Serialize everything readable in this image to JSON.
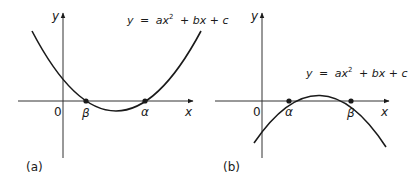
{
  "panels": [
    {
      "id": "a",
      "caption": "(a)",
      "equation": {
        "y": "y",
        "eq": "=",
        "ax": "ax",
        "sup": "2",
        "rest": "+ bx + c"
      },
      "axis_labels": {
        "x": "x",
        "y": "y",
        "origin": "0"
      },
      "roots": [
        {
          "label": "β"
        },
        {
          "label": "α"
        }
      ],
      "opens": "upward"
    },
    {
      "id": "b",
      "caption": "(b)",
      "equation": {
        "y": "y",
        "eq": "=",
        "ax": "ax",
        "sup": "2",
        "rest": "+ bx + c"
      },
      "axis_labels": {
        "x": "x",
        "y": "y",
        "origin": "0"
      },
      "roots": [
        {
          "label": "α"
        },
        {
          "label": "β"
        }
      ],
      "opens": "downward"
    }
  ],
  "colors": {
    "ink": "#1a1a1a",
    "background": "#ffffff"
  }
}
